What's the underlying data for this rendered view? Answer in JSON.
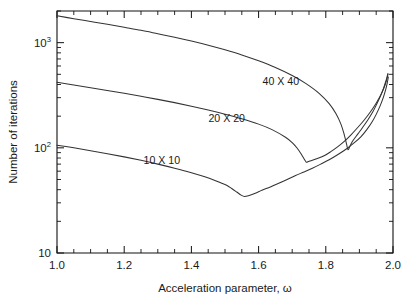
{
  "chart_data": {
    "type": "line",
    "title": "",
    "xlabel": "Acceleration parameter, ω",
    "ylabel": "Number of iterations",
    "xscale": "linear",
    "yscale": "log",
    "xlim": [
      1.0,
      2.0
    ],
    "ylim": [
      10,
      2000
    ],
    "grid": false,
    "legend_position": "inline-annotations",
    "x_major_ticks": [
      "1.0",
      "1.2",
      "1.4",
      "1.6",
      "1.8",
      "2.0"
    ],
    "x_major_tick_values": [
      1.0,
      1.2,
      1.4,
      1.6,
      1.8,
      2.0
    ],
    "x_minor_tick_step": 0.05,
    "y_major_tick_values": [
      10,
      100,
      1000
    ],
    "y_major_tick_labels": [
      {
        "mantissa": "10",
        "exponent": ""
      },
      {
        "mantissa": "10",
        "exponent": "2"
      },
      {
        "mantissa": "10",
        "exponent": "3"
      }
    ],
    "series": [
      {
        "name": "40 X 40",
        "label": "40 X 40",
        "label_x": 1.666,
        "label_y": 430,
        "color": "#333333",
        "points": [
          [
            1.0,
            1800
          ],
          [
            1.05,
            1690
          ],
          [
            1.1,
            1590
          ],
          [
            1.15,
            1495
          ],
          [
            1.2,
            1400
          ],
          [
            1.25,
            1310
          ],
          [
            1.3,
            1215
          ],
          [
            1.35,
            1125
          ],
          [
            1.4,
            1035
          ],
          [
            1.45,
            945
          ],
          [
            1.5,
            855
          ],
          [
            1.55,
            765
          ],
          [
            1.6,
            672
          ],
          [
            1.65,
            580
          ],
          [
            1.7,
            487
          ],
          [
            1.74,
            410
          ],
          [
            1.78,
            330
          ],
          [
            1.81,
            263
          ],
          [
            1.83,
            212
          ],
          [
            1.845,
            168
          ],
          [
            1.855,
            133
          ],
          [
            1.862,
            108
          ],
          [
            1.866,
            96
          ],
          [
            1.872,
            104
          ],
          [
            1.88,
            116
          ],
          [
            1.895,
            135
          ],
          [
            1.91,
            157
          ],
          [
            1.925,
            184
          ],
          [
            1.94,
            220
          ],
          [
            1.952,
            262
          ],
          [
            1.962,
            307
          ],
          [
            1.97,
            355
          ],
          [
            1.976,
            405
          ],
          [
            1.981,
            455
          ],
          [
            1.985,
            510
          ]
        ]
      },
      {
        "name": "20 X 20",
        "label": "20 X 20",
        "label_x": 1.505,
        "label_y": 192,
        "color": "#333333",
        "points": [
          [
            1.0,
            420
          ],
          [
            1.05,
            396
          ],
          [
            1.1,
            373
          ],
          [
            1.15,
            351
          ],
          [
            1.2,
            330
          ],
          [
            1.25,
            309
          ],
          [
            1.3,
            289
          ],
          [
            1.35,
            269
          ],
          [
            1.4,
            249
          ],
          [
            1.45,
            229
          ],
          [
            1.5,
            209
          ],
          [
            1.55,
            189
          ],
          [
            1.6,
            168
          ],
          [
            1.64,
            149
          ],
          [
            1.68,
            126
          ],
          [
            1.7,
            112
          ],
          [
            1.715,
            99
          ],
          [
            1.728,
            86
          ],
          [
            1.736,
            78
          ],
          [
            1.742,
            73
          ],
          [
            1.748,
            74
          ],
          [
            1.76,
            76
          ],
          [
            1.775,
            79
          ],
          [
            1.795,
            84
          ],
          [
            1.815,
            92
          ],
          [
            1.835,
            102
          ],
          [
            1.855,
            115
          ],
          [
            1.875,
            133
          ],
          [
            1.895,
            156
          ],
          [
            1.915,
            185
          ],
          [
            1.932,
            218
          ],
          [
            1.948,
            260
          ],
          [
            1.96,
            303
          ],
          [
            1.97,
            352
          ],
          [
            1.977,
            400
          ],
          [
            1.982,
            452
          ],
          [
            1.985,
            500
          ]
        ]
      },
      {
        "name": "10 X 10",
        "label": "10 X 10",
        "label_x": 1.312,
        "label_y": 76,
        "color": "#333333",
        "points": [
          [
            1.0,
            106
          ],
          [
            1.05,
            100
          ],
          [
            1.1,
            94
          ],
          [
            1.15,
            88
          ],
          [
            1.2,
            82
          ],
          [
            1.25,
            76
          ],
          [
            1.3,
            70
          ],
          [
            1.35,
            64
          ],
          [
            1.4,
            58
          ],
          [
            1.44,
            53
          ],
          [
            1.47,
            49
          ],
          [
            1.49,
            46
          ],
          [
            1.505,
            44
          ],
          [
            1.52,
            41
          ],
          [
            1.535,
            38
          ],
          [
            1.548,
            35.5
          ],
          [
            1.558,
            34.5
          ],
          [
            1.572,
            35.3
          ],
          [
            1.59,
            37
          ],
          [
            1.61,
            39.5
          ],
          [
            1.635,
            42.5
          ],
          [
            1.66,
            46
          ],
          [
            1.685,
            50
          ],
          [
            1.71,
            54.5
          ],
          [
            1.735,
            59
          ],
          [
            1.76,
            64
          ],
          [
            1.785,
            70
          ],
          [
            1.81,
            77
          ],
          [
            1.835,
            86
          ],
          [
            1.86,
            97
          ],
          [
            1.885,
            112
          ],
          [
            1.905,
            128
          ],
          [
            1.922,
            149
          ],
          [
            1.938,
            177
          ],
          [
            1.95,
            208
          ],
          [
            1.962,
            252
          ],
          [
            1.971,
            300
          ],
          [
            1.978,
            355
          ],
          [
            1.983,
            415
          ],
          [
            1.986,
            470
          ]
        ]
      }
    ]
  },
  "plot_geometry": {
    "left": 57,
    "right": 393,
    "top": 11,
    "bottom": 253
  }
}
